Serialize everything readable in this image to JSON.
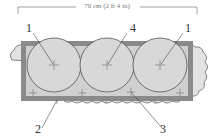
{
  "diagram": {
    "dimension_label": "70 cm (2 ft 4 in)",
    "callouts": [
      {
        "id": "1a",
        "label": "1"
      },
      {
        "id": "4",
        "label": "4"
      },
      {
        "id": "1b",
        "label": "1"
      },
      {
        "id": "2",
        "label": "2"
      },
      {
        "id": "3",
        "label": "3"
      }
    ],
    "colors": {
      "container_border": "#8a8a8a",
      "container_fill": "#c8c8c8",
      "plant_circle": "#d8d8d8",
      "trailing_foliage": "#e2e2e2",
      "outline": "#555555"
    }
  }
}
